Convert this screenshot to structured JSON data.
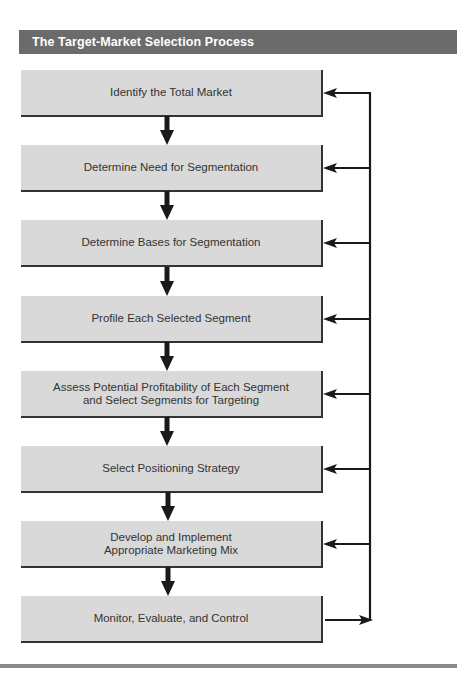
{
  "header": {
    "title": "The Target-Market Selection Process"
  },
  "colors": {
    "title_bar": "#6b6b6b",
    "box_fill": "#d9d9d9",
    "line": "#1a1a1a"
  },
  "steps": [
    {
      "label": "Identify the Total Market"
    },
    {
      "label": "Determine Need for Segmentation"
    },
    {
      "label": "Determine Bases for Segmentation"
    },
    {
      "label": "Profile Each Selected Segment"
    },
    {
      "label": "Assess Potential Profitability of Each Segment\nand Select Segments for Targeting"
    },
    {
      "label": "Select Positioning Strategy"
    },
    {
      "label": "Develop and Implement\nAppropriate Marketing Mix"
    },
    {
      "label": "Monitor, Evaluate, and Control"
    }
  ],
  "feedback_loop": {
    "from_step": 8,
    "to_steps": [
      1,
      2,
      3,
      4,
      5,
      6,
      7
    ]
  }
}
